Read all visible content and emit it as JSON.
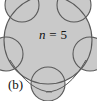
{
  "figure": {
    "part_label": "(b)",
    "n_label": {
      "variable": "n",
      "relation": " = ",
      "value": "5",
      "full": "n = 5"
    },
    "colors": {
      "fill": "#c9c9c9",
      "stroke": "#4a4a4a",
      "background": "#ffffff",
      "text": "#111111"
    },
    "geometry": {
      "description": "central shaded disk with 5 overlapping circular arcs around its boundary",
      "petal_count": 5,
      "center_x": 48,
      "center_y": 40,
      "main_radius": 44,
      "petal_radius": 17
    }
  }
}
